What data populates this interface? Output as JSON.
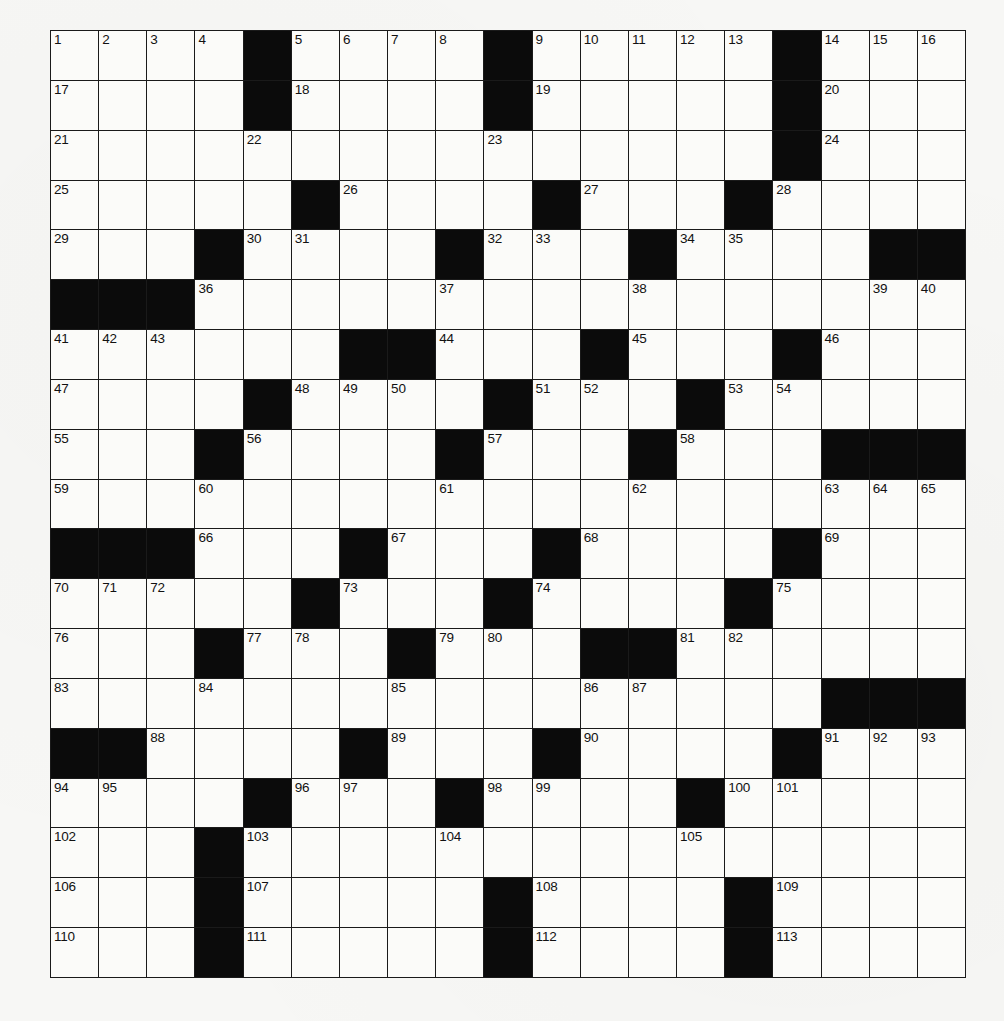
{
  "page": {
    "header_left_fragment": "",
    "header_right_fragment": ""
  },
  "puzzle": {
    "rows": 19,
    "cols": 19,
    "grid": [
      [
        "1",
        "2",
        "3",
        "4",
        "#",
        "5",
        "6",
        "7",
        "8",
        "#",
        "9",
        "10",
        "11",
        "12",
        "13",
        "#",
        "14",
        "15",
        "16"
      ],
      [
        "17",
        ".",
        ".",
        ".",
        "#",
        "18",
        ".",
        ".",
        ".",
        "#",
        "19",
        ".",
        ".",
        ".",
        ".",
        "#",
        "20",
        ".",
        "."
      ],
      [
        "21",
        ".",
        ".",
        ".",
        "22",
        ".",
        ".",
        ".",
        ".",
        "23",
        ".",
        ".",
        ".",
        ".",
        ".",
        "#",
        "24",
        ".",
        "."
      ],
      [
        "25",
        ".",
        ".",
        ".",
        ".",
        "#",
        "26",
        ".",
        ".",
        ".",
        "#",
        "27",
        ".",
        ".",
        "#",
        "28",
        ".",
        ".",
        "."
      ],
      [
        "29",
        ".",
        ".",
        "#",
        "30",
        "31",
        ".",
        ".",
        "#",
        "32",
        "33",
        ".",
        "#",
        "34",
        "35",
        ".",
        ".",
        "#",
        "#"
      ],
      [
        "#",
        "#",
        "#",
        "36",
        ".",
        ".",
        ".",
        ".",
        "37",
        ".",
        ".",
        ".",
        "38",
        ".",
        ".",
        ".",
        ".",
        "39",
        "40"
      ],
      [
        "41",
        "42",
        "43",
        ".",
        ".",
        ".",
        "#",
        "#",
        "44",
        ".",
        ".",
        "#",
        "45",
        ".",
        ".",
        "#",
        "46",
        ".",
        "."
      ],
      [
        "47",
        ".",
        ".",
        ".",
        "#",
        "48",
        "49",
        "50",
        ".",
        "#",
        "51",
        "52",
        ".",
        "#",
        "53",
        "54",
        ".",
        ".",
        "."
      ],
      [
        "55",
        ".",
        ".",
        "#",
        "56",
        ".",
        ".",
        ".",
        "#",
        "57",
        ".",
        ".",
        "#",
        "58",
        ".",
        ".",
        "#",
        "#",
        "#"
      ],
      [
        "59",
        ".",
        ".",
        "60",
        ".",
        ".",
        ".",
        ".",
        "61",
        ".",
        ".",
        ".",
        "62",
        ".",
        ".",
        ".",
        "63",
        "64",
        "65"
      ],
      [
        "#",
        "#",
        "#",
        "66",
        ".",
        ".",
        "#",
        "67",
        ".",
        ".",
        "#",
        "68",
        ".",
        ".",
        ".",
        "#",
        "69",
        ".",
        "."
      ],
      [
        "70",
        "71",
        "72",
        ".",
        ".",
        "#",
        "73",
        ".",
        ".",
        "#",
        "74",
        ".",
        ".",
        ".",
        "#",
        "75",
        ".",
        ".",
        "."
      ],
      [
        "76",
        ".",
        ".",
        "#",
        "77",
        "78",
        ".",
        "#",
        "79",
        "80",
        ".",
        "#",
        "#",
        "81",
        "82",
        ".",
        ".",
        ".",
        "."
      ],
      [
        "83",
        ".",
        ".",
        "84",
        ".",
        ".",
        ".",
        "85",
        ".",
        ".",
        ".",
        "86",
        "87",
        ".",
        ".",
        ".",
        "#",
        "#",
        "#"
      ],
      [
        "#",
        "#",
        "88",
        ".",
        ".",
        ".",
        "#",
        "89",
        ".",
        ".",
        "#",
        "90",
        ".",
        ".",
        ".",
        "#",
        "91",
        "92",
        "93"
      ],
      [
        "94",
        "95",
        ".",
        ".",
        "#",
        "96",
        "97",
        ".",
        "#",
        "98",
        "99",
        ".",
        ".",
        "#",
        "100",
        "101",
        ".",
        ".",
        "."
      ],
      [
        "102",
        ".",
        ".",
        "#",
        "103",
        ".",
        ".",
        ".",
        "104",
        ".",
        ".",
        ".",
        ".",
        "105",
        ".",
        ".",
        ".",
        ".",
        "."
      ],
      [
        "106",
        ".",
        ".",
        "#",
        "107",
        ".",
        ".",
        ".",
        ".",
        "#",
        "108",
        ".",
        ".",
        ".",
        "#",
        "109",
        ".",
        ".",
        "."
      ],
      [
        "110",
        ".",
        ".",
        "#",
        "111",
        ".",
        ".",
        ".",
        ".",
        "#",
        "112",
        ".",
        ".",
        ".",
        "#",
        "113",
        ".",
        ".",
        "."
      ]
    ],
    "legend": {
      "#": "black square",
      ".": "empty white square",
      "number": "white square with clue number"
    },
    "colors": {
      "block": "#0b0b0b",
      "cell": "#fbfbf9",
      "line": "#1a1a1a",
      "paper": "#f7f7f5"
    }
  }
}
